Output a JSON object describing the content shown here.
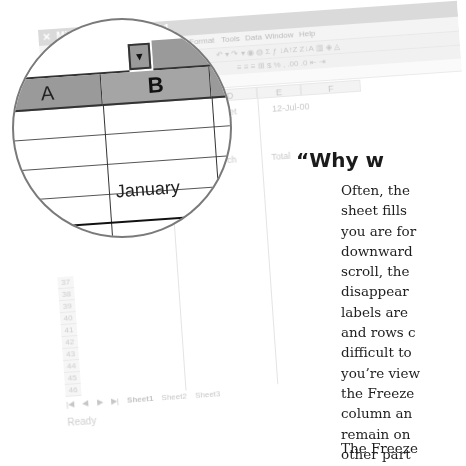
{
  "excel": {
    "title": "Microsoft Excel - Book1",
    "menu": [
      "Format",
      "Tools",
      "Data",
      "Window",
      "Help"
    ],
    "toolbar_standard_icons": [
      "undo-icon",
      "redo-icon",
      "hyperlink-icon",
      "web-icon",
      "autosum-icon",
      "function-icon",
      "sort-ascending-icon",
      "sort-descending-icon",
      "chart-wizard-icon",
      "map-icon",
      "drawing-icon"
    ],
    "toolbar_standard_glyphs": "↶ ▾ ↷ ▾  ◉ ◍  Σ ƒ ↓A↑Z Z↓A  ▥ ◈ ◬",
    "toolbar_formatting_icons": [
      "align-left-icon",
      "align-center-icon",
      "align-right-icon",
      "merge-center-icon",
      "currency-icon",
      "percent-icon",
      "comma-icon",
      "increase-decimal-icon",
      "decrease-decimal-icon",
      "decrease-indent-icon",
      "increase-indent-icon"
    ],
    "toolbar_formatting_glyphs": "≡ ≡ ≡ ⊞  $ %  ,  .00 .0  ⇤ ⇥",
    "columns": [
      "D",
      "E",
      "F"
    ],
    "cells": {
      "d_budget": "Budget",
      "e_date": "12-Jul-00",
      "d_march": "March",
      "e_total": "Total"
    },
    "row_numbers": [
      "37",
      "38",
      "39",
      "40",
      "41",
      "42",
      "43",
      "44",
      "45",
      "46",
      "47"
    ],
    "sheet_nav": [
      "|◀",
      "◀",
      "▶",
      "▶|"
    ],
    "sheet_tabs": [
      "Sheet1",
      "Sheet2",
      "Sheet3"
    ],
    "active_sheet": "Sheet1",
    "status": "Ready"
  },
  "magnifier": {
    "column_a": "A",
    "column_b": "B",
    "dropdown_glyph": "▼",
    "cell_b_value": "January"
  },
  "book": {
    "heading": "“Why w",
    "lines": [
      "Often, the",
      "sheet fills",
      "you are for",
      "downward",
      "scroll, the",
      "disappear",
      "labels are",
      "and rows c",
      "difficult to",
      "you’re view",
      "the Freeze",
      "column an",
      "remain on",
      "other part"
    ],
    "next_paragraph": "The Freeze"
  }
}
